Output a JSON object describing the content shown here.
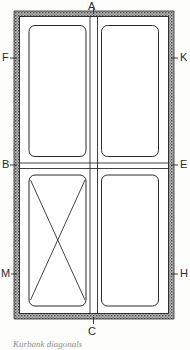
{
  "figure": {
    "kind": "panel-frame-elevation-drawing",
    "caption": "Kurbank diagonals",
    "frame": {
      "outer": {
        "x": 14,
        "y": 11,
        "width": 160,
        "height": 308
      },
      "border_fill": "#8a8a8a",
      "border_thickness": 5,
      "stroke": "#2b2b2b"
    },
    "panels": [
      {
        "name": "upper-left-panel",
        "x": 29,
        "y": 25,
        "width": 58,
        "height": 137
      },
      {
        "name": "upper-right-panel",
        "x": 100,
        "y": 25,
        "width": 58,
        "height": 137
      },
      {
        "name": "lower-left-panel",
        "x": 29,
        "y": 169,
        "width": 58,
        "height": 137,
        "has_diagonals": true
      },
      {
        "name": "lower-right-panel",
        "x": 100,
        "y": 169,
        "width": 58,
        "height": 137,
        "has_diagonals": false
      }
    ],
    "labels": [
      {
        "id": "A",
        "text": "A",
        "side": "top",
        "x": 88,
        "y": 1,
        "tick": {
          "x1": 94,
          "y1": 9,
          "x2": 94,
          "y2": 14
        }
      },
      {
        "id": "F",
        "text": "F",
        "side": "left",
        "x": 2,
        "y": 52,
        "tick": {
          "x1": 10,
          "y1": 58,
          "x2": 17,
          "y2": 58
        }
      },
      {
        "id": "K",
        "text": "K",
        "side": "right",
        "x": 180,
        "y": 52,
        "tick": {
          "x1": 171,
          "y1": 58,
          "x2": 178,
          "y2": 58
        }
      },
      {
        "id": "B",
        "text": "B",
        "side": "left",
        "x": 2,
        "y": 159,
        "tick": {
          "x1": 10,
          "y1": 165,
          "x2": 17,
          "y2": 165
        }
      },
      {
        "id": "E",
        "text": "E",
        "side": "right",
        "x": 180,
        "y": 159,
        "tick": {
          "x1": 171,
          "y1": 165,
          "x2": 178,
          "y2": 165
        }
      },
      {
        "id": "M",
        "text": "M",
        "side": "left",
        "x": 1,
        "y": 268,
        "tick": {
          "x1": 11,
          "y1": 274,
          "x2": 17,
          "y2": 274
        }
      },
      {
        "id": "H",
        "text": "H",
        "side": "right",
        "x": 180,
        "y": 268,
        "tick": {
          "x1": 171,
          "y1": 274,
          "x2": 178,
          "y2": 274
        }
      },
      {
        "id": "C",
        "text": "C",
        "side": "bottom",
        "x": 88,
        "y": 326,
        "tick": {
          "x1": 94,
          "y1": 316,
          "x2": 94,
          "y2": 324
        }
      }
    ],
    "diagonals": {
      "panel": "lower-left-panel",
      "lines": [
        {
          "x1": 31,
          "y1": 178,
          "x2": 85,
          "y2": 298
        },
        {
          "x1": 85,
          "y1": 178,
          "x2": 31,
          "y2": 298
        }
      ],
      "stroke": "#3a3a3a"
    },
    "colors": {
      "ink": "#2b2b2b",
      "hatch": "#7e7e7e",
      "paper": "#fdfdfc",
      "caption": "#8d8d8d"
    }
  }
}
